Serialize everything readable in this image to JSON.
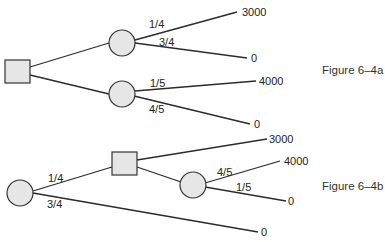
{
  "figures": [
    {
      "caption": "Figure 6–4a",
      "decision_node": "square",
      "branches": [
        {
          "node": "chance",
          "outcomes": [
            {
              "probability": "1/4",
              "payoff": "3000"
            },
            {
              "probability": "3/4",
              "payoff": "0"
            }
          ]
        },
        {
          "node": "chance",
          "outcomes": [
            {
              "probability": "1/5",
              "payoff": "4000"
            },
            {
              "probability": "4/5",
              "payoff": "0"
            }
          ]
        }
      ]
    },
    {
      "caption": "Figure 6–4b",
      "root_node": "chance",
      "branches": [
        {
          "probability": "1/4",
          "node": "decision",
          "options": [
            {
              "payoff": "3000"
            },
            {
              "node": "chance",
              "outcomes": [
                {
                  "probability": "4/5",
                  "payoff": "4000"
                },
                {
                  "probability": "1/5",
                  "payoff": "0"
                }
              ]
            }
          ]
        },
        {
          "probability": "3/4",
          "payoff": "0"
        }
      ]
    }
  ],
  "labels": {
    "a_p1": "1/4",
    "a_p2": "3/4",
    "a_p3": "1/5",
    "a_p4": "4/5",
    "a_v1": "3000",
    "a_v2": "0",
    "a_v3": "4000",
    "a_v4": "0",
    "a_caption": "Figure 6–4a",
    "b_p1": "1/4",
    "b_p2": "3/4",
    "b_p3": "4/5",
    "b_p4": "1/5",
    "b_v1": "3000",
    "b_v2": "4000",
    "b_v3": "0",
    "b_v4": "0",
    "b_caption": "Figure 6–4b"
  }
}
